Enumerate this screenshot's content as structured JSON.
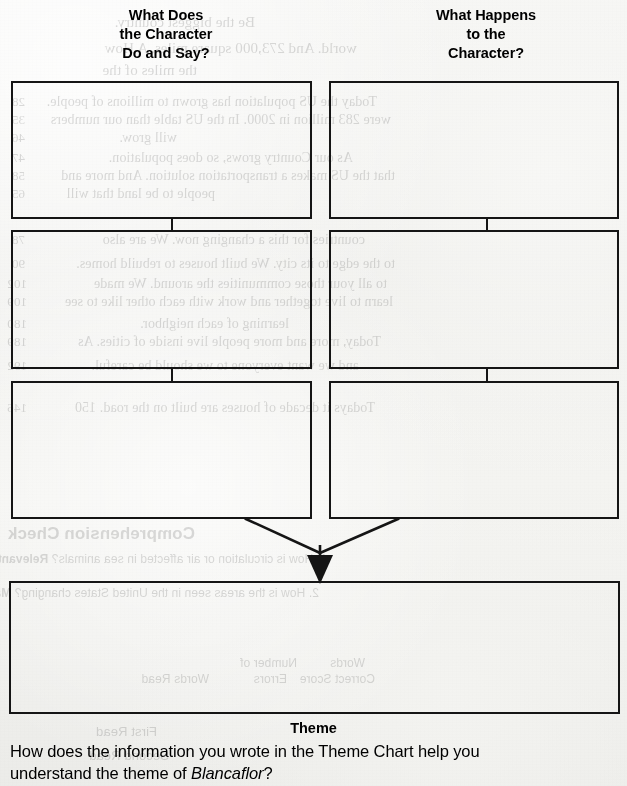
{
  "document": {
    "kind": "worksheet",
    "title": "Theme Chart"
  },
  "columns": [
    {
      "id": "do-and-say",
      "heading_lines": [
        "What Does",
        "the Character",
        "Do and Say?"
      ],
      "cells": [
        {
          "value": ""
        },
        {
          "value": ""
        },
        {
          "value": ""
        }
      ]
    },
    {
      "id": "happens-to",
      "heading_lines": [
        "What Happens",
        "to the",
        "Character?"
      ],
      "cells": [
        {
          "value": ""
        },
        {
          "value": ""
        },
        {
          "value": ""
        }
      ]
    }
  ],
  "theme": {
    "label": "Theme",
    "cell": {
      "value": ""
    }
  },
  "prompt": {
    "before": "How does the information you wrote in the Theme Chart help you understand the theme of ",
    "title": "Blancaflor",
    "after": "?"
  },
  "colors": {
    "ink": "#151515",
    "paper": "#f2f2f0",
    "bleed_ink": "#2a2a2a"
  },
  "bleed_through": {
    "note": "faint mirrored show-through of the reverse page",
    "headings": [
      {
        "text": "Comprehension Check",
        "x": 432,
        "y": 532,
        "size": 17
      },
      {
        "text": "Words",
        "x": 262,
        "y": 662,
        "size": 12
      },
      {
        "text": "Number of",
        "x": 320,
        "y": 662,
        "size": 12
      },
      {
        "text": "Correct Score",
        "x": 258,
        "y": 676,
        "size": 12
      },
      {
        "text": "Errors",
        "x": 337,
        "y": 676,
        "size": 12
      },
      {
        "text": "Words Read",
        "x": 417,
        "y": 676,
        "size": 12
      },
      {
        "text": "First Read",
        "x": 468,
        "y": 730,
        "size": 13
      },
      {
        "text": "Second Read",
        "x": 458,
        "y": 752,
        "size": 13
      }
    ],
    "questions": [
      {
        "text": "1. How is circulation or air affected in sea animals?  Relevant Facts",
        "x": 300,
        "y": 556,
        "size": 12
      },
      {
        "text": "2. How is the areas seen in the United States changing?  Main Ideas and Details",
        "x": 308,
        "y": 588,
        "size": 12
      }
    ],
    "lines": [
      {
        "text": "Be the biggest country.",
        "x": 372,
        "y": 14,
        "size": 15
      },
      {
        "text": "world.  And 273,000 square miles.  A  How",
        "x": 270,
        "y": 40,
        "size": 15
      },
      {
        "text": "the miles of the",
        "x": 430,
        "y": 62,
        "size": 15
      },
      {
        "text": "Today the US population has grown to millions of people.",
        "x": 250,
        "y": 94,
        "size": 14
      },
      {
        "text": "were 283 million in 2000.  In the US table than our numbers",
        "x": 236,
        "y": 112,
        "size": 14
      },
      {
        "text": "will grow.",
        "x": 450,
        "y": 130,
        "size": 14
      },
      {
        "text": "As our Country grows, so does population.",
        "x": 274,
        "y": 150,
        "size": 14
      },
      {
        "text": "that the US makes a transportation solution.  And more and",
        "x": 232,
        "y": 168,
        "size": 14
      },
      {
        "text": "people to be land that will",
        "x": 412,
        "y": 186,
        "size": 14
      },
      {
        "text": "countries for this a changing now.  We are also",
        "x": 262,
        "y": 232,
        "size": 14
      },
      {
        "text": "to the edge to its city.  We built houses to rebuild homes.",
        "x": 232,
        "y": 256,
        "size": 14
      },
      {
        "text": "to all your those communities the around.  We made",
        "x": 240,
        "y": 276,
        "size": 14
      },
      {
        "text": "learn to live together and work with each other like to see",
        "x": 234,
        "y": 294,
        "size": 14
      },
      {
        "text": "learning of each neighbor.",
        "x": 338,
        "y": 316,
        "size": 14
      },
      {
        "text": "Today, more and more people live inside of cities.  As",
        "x": 246,
        "y": 334,
        "size": 14
      },
      {
        "text": "and we want everyone to we should be careful.",
        "x": 268,
        "y": 358,
        "size": 14
      },
      {
        "text": "Todays it  decade of houses are built on the road.  150",
        "x": 252,
        "y": 400,
        "size": 14
      }
    ],
    "gutter_numbers": [
      {
        "text": "28",
        "x": 602,
        "y": 94
      },
      {
        "text": "35",
        "x": 602,
        "y": 112
      },
      {
        "text": "46",
        "x": 602,
        "y": 130
      },
      {
        "text": "47",
        "x": 602,
        "y": 150
      },
      {
        "text": "58",
        "x": 602,
        "y": 168
      },
      {
        "text": "65",
        "x": 602,
        "y": 186
      },
      {
        "text": "78",
        "x": 602,
        "y": 232
      },
      {
        "text": "90",
        "x": 602,
        "y": 256
      },
      {
        "text": "102",
        "x": 600,
        "y": 276
      },
      {
        "text": "109",
        "x": 600,
        "y": 294
      },
      {
        "text": "180",
        "x": 600,
        "y": 316
      },
      {
        "text": "189",
        "x": 600,
        "y": 334
      },
      {
        "text": "192",
        "x": 600,
        "y": 358
      },
      {
        "text": "146",
        "x": 600,
        "y": 400
      }
    ]
  }
}
